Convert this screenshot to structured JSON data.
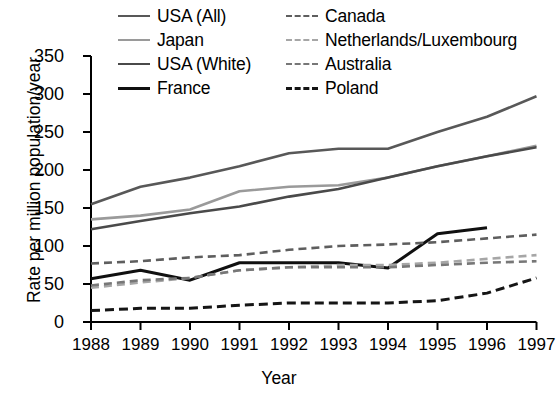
{
  "chart_data": {
    "type": "line",
    "title": "",
    "xlabel": "Year",
    "ylabel": "Rate per million population/year",
    "x": [
      1988,
      1989,
      1990,
      1991,
      1992,
      1993,
      1994,
      1995,
      1996,
      1997
    ],
    "xtick_labels": [
      "1988",
      "1989",
      "1990",
      "1991",
      "1992",
      "1993",
      "1994",
      "1995",
      "1996",
      "1997"
    ],
    "ytick_labels": [
      "0",
      "50",
      "100",
      "150",
      "200",
      "250",
      "300",
      "350"
    ],
    "yticks": [
      0,
      50,
      100,
      150,
      200,
      250,
      300,
      350
    ],
    "xlim": [
      1988,
      1997
    ],
    "ylim": [
      0,
      350
    ],
    "grid": false,
    "legend_position": "top-center",
    "series": [
      {
        "name": "USA (All)",
        "color": "#585858",
        "dash": "solid",
        "width": 2.6,
        "values": [
          155,
          178,
          190,
          205,
          222,
          228,
          228,
          250,
          270,
          297
        ]
      },
      {
        "name": "Japan",
        "color": "#9a9a9a",
        "dash": "solid",
        "width": 2.6,
        "values": [
          135,
          140,
          148,
          172,
          178,
          180,
          190,
          205,
          218,
          232
        ]
      },
      {
        "name": "USA (White)",
        "color": "#4a4a4a",
        "dash": "solid",
        "width": 2.6,
        "values": [
          122,
          133,
          143,
          152,
          165,
          175,
          190,
          205,
          218,
          230
        ]
      },
      {
        "name": "France",
        "color": "#101010",
        "dash": "solid",
        "width": 3.0,
        "values": [
          57,
          68,
          55,
          78,
          78,
          78,
          71,
          116,
          124,
          null
        ]
      },
      {
        "name": "Canada",
        "color": "#5e5e5e",
        "dash": "dashed",
        "width": 2.6,
        "values": [
          77,
          80,
          85,
          88,
          95,
          100,
          102,
          105,
          110,
          115
        ]
      },
      {
        "name": "Netherlands/Luxembourg",
        "color": "#a6a6a6",
        "dash": "dashed",
        "width": 2.6,
        "values": [
          45,
          52,
          58,
          68,
          72,
          75,
          75,
          78,
          83,
          88
        ]
      },
      {
        "name": "Australia",
        "color": "#777777",
        "dash": "dashed",
        "width": 2.6,
        "values": [
          48,
          55,
          58,
          68,
          72,
          72,
          72,
          75,
          78,
          80
        ]
      },
      {
        "name": "Poland",
        "color": "#151515",
        "dash": "dashed",
        "width": 3.0,
        "values": [
          15,
          18,
          18,
          22,
          25,
          25,
          25,
          28,
          38,
          58
        ]
      }
    ]
  },
  "axis": {
    "line_color": "#000000"
  }
}
